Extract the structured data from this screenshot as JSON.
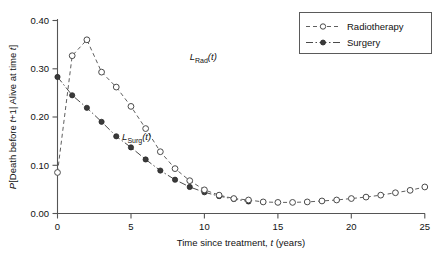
{
  "chart_data": {
    "type": "line",
    "title": "",
    "xlabel": "Time since treatment, t (years)",
    "ylabel": "P[Death before t+1| Alive at time t]",
    "xlim": [
      0,
      25
    ],
    "ylim": [
      0.0,
      0.4
    ],
    "xticks": [
      "0",
      "5",
      "10",
      "15",
      "20",
      "25"
    ],
    "yticks": [
      "0.00",
      "0.10",
      "0.20",
      "0.30",
      "0.40"
    ],
    "grid": false,
    "legend_position": "top-right",
    "series": [
      {
        "name": "Radiotherapy",
        "marker": "open-circle",
        "linestyle": "dashed",
        "x": [
          0,
          1,
          2,
          3,
          4,
          5,
          6,
          7,
          8,
          9,
          10,
          11,
          12,
          13,
          14,
          15,
          16,
          17,
          18,
          19,
          20,
          21,
          22,
          23,
          24,
          25
        ],
        "y": [
          0.085,
          0.327,
          0.36,
          0.293,
          0.262,
          0.222,
          0.176,
          0.128,
          0.093,
          0.068,
          0.049,
          0.038,
          0.031,
          0.028,
          0.024,
          0.023,
          0.023,
          0.024,
          0.026,
          0.028,
          0.031,
          0.034,
          0.038,
          0.043,
          0.048,
          0.055
        ]
      },
      {
        "name": "Surgery",
        "marker": "filled-circle",
        "linestyle": "dash-dot",
        "x": [
          0,
          1,
          2,
          3,
          4,
          5,
          6,
          7,
          8,
          9,
          10,
          11,
          12,
          13
        ],
        "y": [
          0.283,
          0.245,
          0.219,
          0.19,
          0.16,
          0.137,
          0.112,
          0.089,
          0.07,
          0.055,
          0.044,
          0.036,
          0.03,
          0.025
        ]
      }
    ],
    "annotations": [
      {
        "id": "rad-curve-label",
        "text_main": "L",
        "text_sub": "Rad",
        "text_tail": "(t)",
        "x": 9.0,
        "y": 0.318
      },
      {
        "id": "surg-curve-label",
        "text_main": "L",
        "text_sub": "Surg",
        "text_tail": "(t)",
        "x": 4.4,
        "y": 0.152
      }
    ]
  },
  "legend": {
    "items": [
      {
        "label": "Radiotherapy",
        "marker": "open-circle",
        "linestyle": "dashed"
      },
      {
        "label": "Surgery",
        "marker": "filled-circle",
        "linestyle": "dash-dot"
      }
    ]
  },
  "axis": {
    "y_title_parts": {
      "p": "P",
      "rest_a": "[Death before ",
      "t1": "t",
      "rest_b": "+1| Alive at time ",
      "t2": "t",
      "rest_c": "]"
    },
    "x_title_parts": {
      "lead": "Time since treatment, ",
      "t": "t",
      "tail": " (years)"
    }
  },
  "colors": {
    "axis": "#555555",
    "radiotherapy": "#5f5f5f",
    "surgery": "#3a3a3a",
    "background": "#ffffff"
  }
}
